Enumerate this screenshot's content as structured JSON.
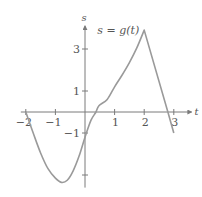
{
  "chart_data": {
    "type": "line",
    "title": "",
    "function_label": "s = g(t)",
    "xlabel": "t",
    "ylabel": "s",
    "xlim": [
      -2.1,
      3.6
    ],
    "ylim": [
      -3.6,
      4.1
    ],
    "x_ticks": [
      -2,
      -1,
      1,
      2,
      3
    ],
    "x_tick_labels": [
      "−2",
      "−1",
      "1",
      "2",
      "3"
    ],
    "y_ticks": [
      3,
      1,
      -1,
      -3
    ],
    "y_tick_labels": [
      "3",
      "1",
      "−1",
      ""
    ],
    "grid": false,
    "legend": "none",
    "series": [
      {
        "name": "g(t)",
        "color": "#9a9a9a",
        "x": [
          -2,
          -1.75,
          -1.5,
          -1.25,
          -1,
          -0.8,
          -0.6,
          -0.4,
          -0.2,
          0,
          0.2,
          0.37,
          0.47,
          0.75,
          1,
          1.25,
          1.5,
          1.75,
          2,
          2.8,
          3
        ],
        "y": [
          0,
          -1.0,
          -1.95,
          -2.7,
          -3.15,
          -3.35,
          -3.25,
          -2.8,
          -2.1,
          -1.2,
          -0.4,
          0,
          0.3,
          0.6,
          1.2,
          1.75,
          2.35,
          3.05,
          3.9,
          0,
          -1
        ]
      }
    ]
  },
  "layout": {
    "origin_px": [
      85,
      112
    ],
    "px_per_x": 29.6,
    "px_per_y": 21,
    "axis_color": "#7a7a7a"
  }
}
